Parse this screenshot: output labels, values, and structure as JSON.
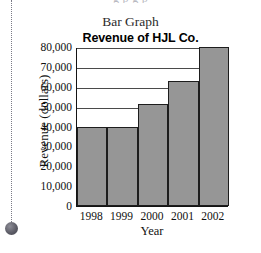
{
  "decor": {
    "pin_rule": "dotted-vertical-rule",
    "pin_dot": "bullet-marker",
    "top_fragment": "g p  g p"
  },
  "caption": "Bar Graph",
  "chart_data": {
    "type": "bar",
    "title": "Revenue of HJL Co.",
    "xlabel": "Year",
    "ylabel": "Revenue (dollars)",
    "categories": [
      "1998",
      "1999",
      "2000",
      "2001",
      "2002"
    ],
    "values": [
      40000,
      40000,
      51500,
      63000,
      80000
    ],
    "ylim": [
      0,
      80000
    ],
    "yticks": [
      0,
      10000,
      20000,
      30000,
      40000,
      50000,
      60000,
      70000,
      80000
    ],
    "ytick_labels": [
      "0",
      "10,000",
      "20,000",
      "30,000",
      "40,000",
      "50,000",
      "60,000",
      "70,000",
      "80,000"
    ],
    "grid": "horizontal",
    "legend": "none",
    "bar_color": "#969696",
    "bar_edge_color": "#1d1d1d",
    "axis_color": "#141414"
  }
}
